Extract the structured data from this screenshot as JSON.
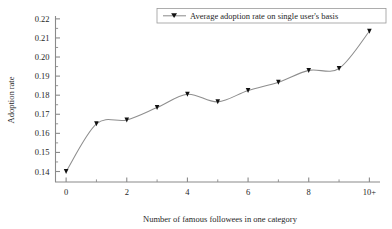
{
  "chart_data": {
    "type": "line",
    "title": "",
    "xlabel": "Number of famous followees in one category",
    "ylabel": "Adoption rate",
    "xlim": [
      -0.35,
      10.35
    ],
    "ylim": [
      0.1345,
      0.2215
    ],
    "grid": false,
    "legend_position": "top-right",
    "x": [
      0,
      1,
      2,
      3,
      4,
      5,
      6,
      7,
      8,
      9,
      10
    ],
    "x_tick_labels_major": [
      "0",
      "2",
      "4",
      "6",
      "8",
      "10+"
    ],
    "x_tick_values_major": [
      0,
      2,
      4,
      6,
      8,
      10
    ],
    "x_tick_values_minor": [
      1,
      3,
      5,
      7,
      9
    ],
    "y_tick_labels": [
      "0.14",
      "0.15",
      "0.16",
      "0.17",
      "0.18",
      "0.19",
      "0.20",
      "0.21",
      "0.22"
    ],
    "y_tick_values": [
      0.14,
      0.15,
      0.16,
      0.17,
      0.18,
      0.19,
      0.2,
      0.21,
      0.22
    ],
    "series": [
      {
        "name": "Average adoption rate on single user's basis",
        "marker": "triangle-down",
        "color": "#8e8e8e",
        "marker_color": "#111111",
        "values": [
          0.14,
          0.165,
          0.167,
          0.1735,
          0.1805,
          0.1765,
          0.1825,
          0.1868,
          0.193,
          0.194,
          0.2135
        ]
      }
    ]
  },
  "legend": {
    "entries": [
      {
        "label": "Average adoption rate on single user's basis"
      }
    ]
  },
  "axes": {
    "x_title": "Number of famous followees in one category",
    "y_title": "Adoption rate"
  }
}
